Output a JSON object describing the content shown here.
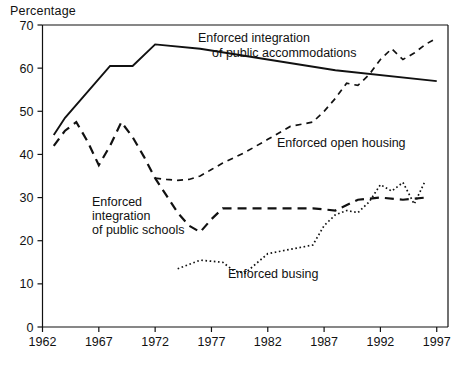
{
  "axis_title": "Percentage",
  "labels": {
    "accommodations_line1": "Enforced integration",
    "accommodations_line2": "of public accommodations",
    "open_housing": "Enforced open housing",
    "schools_line1": "Enforced",
    "schools_line2": "integration",
    "schools_line3": "of public schools",
    "busing": "Enforced busing"
  },
  "colors": {
    "ink": "#111111",
    "background": "#ffffff"
  },
  "chart_data": {
    "type": "line",
    "title": "",
    "subtitle": "",
    "xlabel": "",
    "ylabel": "Percentage",
    "xlim": [
      1962,
      1998
    ],
    "ylim": [
      0,
      70
    ],
    "grid": false,
    "legend_position": "inline-annotations",
    "xticks": [
      1962,
      1967,
      1972,
      1977,
      1982,
      1987,
      1992,
      1997
    ],
    "yticks": [
      0,
      10,
      20,
      30,
      40,
      50,
      60,
      70
    ],
    "series": [
      {
        "name": "Enforced integration of public accommodations",
        "style": "solid",
        "x": [
          1963,
          1964,
          1968,
          1970,
          1972,
          1976,
          1988,
          1997
        ],
        "values": [
          44.5,
          48.5,
          60.5,
          60.5,
          65.5,
          64.5,
          59.5,
          57.0
        ]
      },
      {
        "name": "Enforced integration of public schools",
        "style": "long-dash",
        "x": [
          1963,
          1964,
          1965,
          1966,
          1967,
          1968,
          1969,
          1970,
          1971,
          1972,
          1973,
          1974,
          1975,
          1976,
          1977,
          1978,
          1980,
          1982,
          1984,
          1986,
          1988,
          1990,
          1992,
          1994,
          1996
        ],
        "values": [
          42.0,
          45.5,
          47.5,
          43.0,
          37.5,
          42.0,
          47.5,
          44.0,
          39.5,
          34.5,
          30.5,
          26.5,
          23.5,
          22.0,
          25.0,
          27.5,
          27.5,
          27.5,
          27.5,
          27.5,
          27.0,
          29.5,
          30.0,
          29.5,
          30.0
        ]
      },
      {
        "name": "Enforced open housing",
        "style": "dash",
        "x": [
          1972,
          1973,
          1974,
          1975,
          1976,
          1977,
          1978,
          1980,
          1982,
          1984,
          1985,
          1986,
          1987,
          1988,
          1989,
          1990,
          1991,
          1992,
          1993,
          1994,
          1995,
          1996,
          1997
        ],
        "values": [
          34.5,
          34.2,
          34.0,
          34.2,
          35.0,
          36.5,
          38.0,
          40.5,
          43.5,
          46.5,
          47.0,
          47.5,
          50.0,
          53.0,
          56.5,
          56.0,
          58.5,
          62.0,
          64.5,
          62.0,
          63.5,
          65.5,
          67.0
        ]
      },
      {
        "name": "Enforced busing",
        "style": "dotted",
        "x": [
          1974,
          1976,
          1978,
          1979,
          1980,
          1982,
          1983,
          1984,
          1986,
          1987,
          1988,
          1989,
          1990,
          1991,
          1992,
          1993,
          1994,
          1995,
          1996
        ],
        "values": [
          13.5,
          15.5,
          15.0,
          13.0,
          12.5,
          17.0,
          17.5,
          18.0,
          19.0,
          23.5,
          26.0,
          27.0,
          26.5,
          29.0,
          33.0,
          31.5,
          33.5,
          28.5,
          34.0
        ]
      }
    ]
  }
}
